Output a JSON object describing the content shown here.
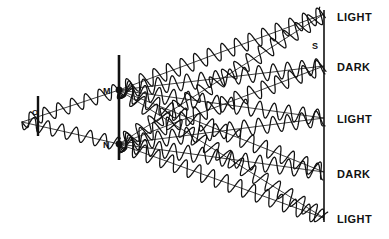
{
  "figure": {
    "kind": "physics-diagram",
    "topic": "youngs-double-slit-interference",
    "background_color": "#ffffff",
    "ink_color": "#111111"
  },
  "labels": {
    "source": "O",
    "slit_upper": "M",
    "slit_lower": "N",
    "screen": "S"
  },
  "bands": [
    {
      "text": "LIGHT",
      "y": 18
    },
    {
      "text": "DARK",
      "y": 68
    },
    {
      "text": "LIGHT",
      "y": 120
    },
    {
      "text": "DARK",
      "y": 175
    },
    {
      "text": "LIGHT",
      "y": 220
    }
  ],
  "chart_data": {
    "type": "line",
    "xlabel": "",
    "ylabel": "",
    "xlim": [
      0,
      389
    ],
    "ylim": [
      0,
      239
    ],
    "grid": false,
    "legend": "none",
    "annotations": [
      {
        "label": "O",
        "x": 36,
        "y": 114,
        "role": "light-source"
      },
      {
        "label": "M",
        "x": 107,
        "y": 92,
        "role": "upper-slit"
      },
      {
        "label": "N",
        "x": 107,
        "y": 146,
        "role": "lower-slit"
      },
      {
        "label": "S",
        "x": 316,
        "y": 47,
        "role": "screen"
      },
      {
        "label": "LIGHT",
        "x": 337,
        "y": 18,
        "role": "fringe-bright"
      },
      {
        "label": "DARK",
        "x": 337,
        "y": 68,
        "role": "fringe-dark"
      },
      {
        "label": "LIGHT",
        "x": 337,
        "y": 120,
        "role": "fringe-bright"
      },
      {
        "label": "DARK",
        "x": 337,
        "y": 175,
        "role": "fringe-dark"
      },
      {
        "label": "LIGHT",
        "x": 337,
        "y": 220,
        "role": "fringe-bright"
      }
    ],
    "elements": {
      "source_barrier": {
        "x": 38,
        "y_top": 96,
        "y_bottom": 136
      },
      "slit_barrier": {
        "x": 119,
        "y_top": 55,
        "y_bottom": 160
      },
      "screen_line": {
        "x": 324,
        "y_top": 10,
        "y_bottom": 222
      },
      "slit_upper": {
        "x": 119,
        "y": 90
      },
      "slit_lower": {
        "x": 119,
        "y": 144
      },
      "source_point": {
        "x": 38,
        "y": 117
      }
    },
    "series": [
      {
        "name": "source-to-M",
        "from": [
          22,
          122
        ],
        "to": [
          119,
          90
        ],
        "amplitude": 7,
        "wavelength": 14.5
      },
      {
        "name": "source-to-N",
        "from": [
          22,
          122
        ],
        "to": [
          119,
          144
        ],
        "amplitude": 7,
        "wavelength": 14.5
      },
      {
        "name": "M-ray-1",
        "from": [
          119,
          90
        ],
        "to": [
          324,
          14
        ],
        "amplitude": 8,
        "wavelength": 14.5
      },
      {
        "name": "M-ray-2",
        "from": [
          119,
          90
        ],
        "to": [
          324,
          66
        ],
        "amplitude": 8,
        "wavelength": 14.5
      },
      {
        "name": "M-ray-3",
        "from": [
          119,
          90
        ],
        "to": [
          324,
          118
        ],
        "amplitude": 8,
        "wavelength": 14.5
      },
      {
        "name": "M-ray-4",
        "from": [
          119,
          90
        ],
        "to": [
          324,
          172
        ],
        "amplitude": 8,
        "wavelength": 14.5
      },
      {
        "name": "M-ray-5",
        "from": [
          119,
          90
        ],
        "to": [
          324,
          218
        ],
        "amplitude": 8,
        "wavelength": 14.5
      },
      {
        "name": "N-ray-1",
        "from": [
          119,
          144
        ],
        "to": [
          324,
          14
        ],
        "amplitude": 8,
        "wavelength": 14.5
      },
      {
        "name": "N-ray-2",
        "from": [
          119,
          144
        ],
        "to": [
          324,
          66
        ],
        "amplitude": 8,
        "wavelength": 14.5
      },
      {
        "name": "N-ray-3",
        "from": [
          119,
          144
        ],
        "to": [
          324,
          118
        ],
        "amplitude": 8,
        "wavelength": 14.5
      },
      {
        "name": "N-ray-4",
        "from": [
          119,
          144
        ],
        "to": [
          324,
          172
        ],
        "amplitude": 8,
        "wavelength": 14.5
      },
      {
        "name": "N-ray-5",
        "from": [
          119,
          144
        ],
        "to": [
          324,
          218
        ],
        "amplitude": 8,
        "wavelength": 14.5
      }
    ]
  }
}
